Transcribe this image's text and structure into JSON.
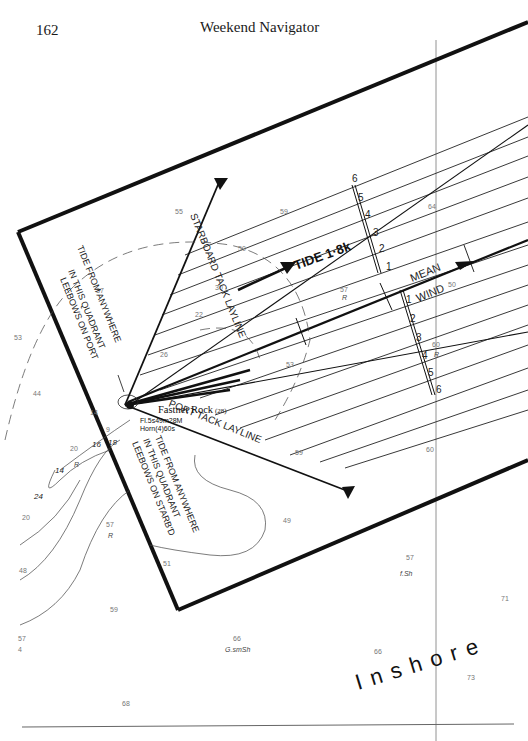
{
  "header": {
    "page_number": "162",
    "running_title": "Weekend Navigator"
  },
  "diagram": {
    "landmark": {
      "name": "Fastnet Rock",
      "height": "(28)",
      "light": "Fl.5s49m28M",
      "fog_signal": "Horn(4)60s"
    },
    "laylines": {
      "starboard": "STARBOARD TACK LAYLINE",
      "port": "PORT TACK LAYLINE"
    },
    "tide_note_port": [
      "TIDE FROM ANYWHERE",
      "IN THIS QUADRANT",
      "LEEBOWS ON PORT"
    ],
    "tide_note_starboard": [
      "TIDE FROM ANYWHERE",
      "IN THIS QUADRANT",
      "LEEBOWS ON STARB'D"
    ],
    "tide_label": "TIDE 1·8k",
    "mean_wind": [
      "MEAN",
      "WIND"
    ],
    "scale_upper": [
      "6",
      "5",
      "4",
      "3",
      "2",
      "1"
    ],
    "scale_lower": [
      "1",
      "2",
      "3",
      "4",
      "5",
      "6"
    ],
    "area_label": "Inshore",
    "seabed": [
      "R",
      "R",
      "R",
      "f.Sh",
      "G.smSh",
      "R"
    ],
    "soundings": [
      "55",
      "59",
      "64",
      "50",
      "30",
      "22",
      "26",
      "57",
      "50",
      "53",
      "60",
      "59",
      "60",
      "49",
      "57",
      "51",
      "44",
      "53",
      "37",
      "20",
      "14",
      "9",
      "16",
      "18",
      "14",
      "24",
      "20",
      "48",
      "57",
      "59",
      "66",
      "66",
      "71",
      "73",
      "68",
      "57",
      "4"
    ]
  }
}
